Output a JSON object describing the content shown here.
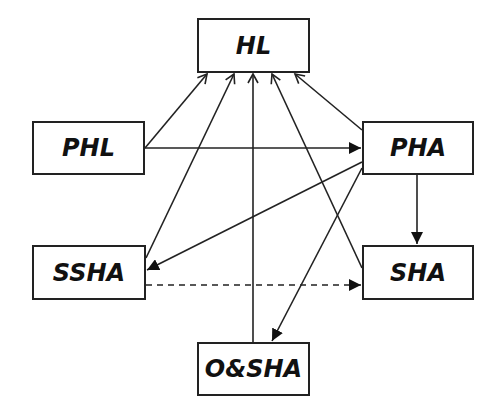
{
  "diagram": {
    "type": "path-model",
    "nodes": [
      {
        "id": "HL",
        "label": "HL"
      },
      {
        "id": "PHL",
        "label": "PHL"
      },
      {
        "id": "PHA",
        "label": "PHA"
      },
      {
        "id": "SSHA",
        "label": "SSHA"
      },
      {
        "id": "SHA",
        "label": "SHA"
      },
      {
        "id": "OSHA",
        "label": "O&SHA"
      }
    ],
    "edges": [
      {
        "from": "PHL",
        "to": "HL",
        "style": "solid"
      },
      {
        "from": "PHL",
        "to": "PHA",
        "style": "solid"
      },
      {
        "from": "PHA",
        "to": "HL",
        "style": "solid"
      },
      {
        "from": "PHA",
        "to": "SHA",
        "style": "solid"
      },
      {
        "from": "PHA",
        "to": "SSHA",
        "style": "solid"
      },
      {
        "from": "PHA",
        "to": "O&SHA",
        "style": "solid"
      },
      {
        "from": "SSHA",
        "to": "HL",
        "style": "solid"
      },
      {
        "from": "SHA",
        "to": "HL",
        "style": "solid"
      },
      {
        "from": "O&SHA",
        "to": "HL",
        "style": "solid"
      },
      {
        "from": "SSHA",
        "to": "SHA",
        "style": "dashed"
      }
    ]
  }
}
